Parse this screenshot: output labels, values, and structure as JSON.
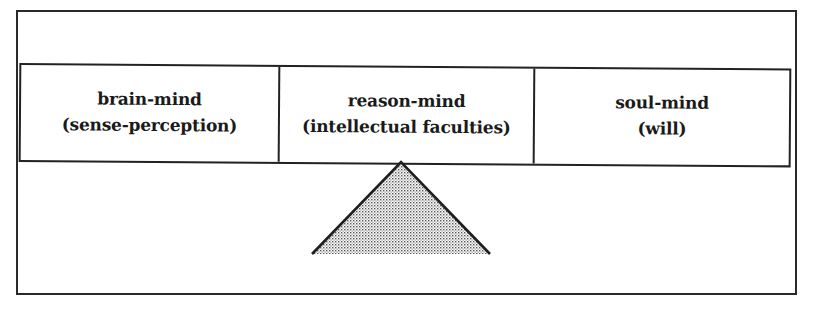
{
  "diagram": {
    "type": "balance-scale",
    "beam": {
      "sections": [
        {
          "title": "brain-mind",
          "subtitle": "(sense-perception)"
        },
        {
          "title": "reason-mind",
          "subtitle": "(intellectual faculties)"
        },
        {
          "title": "soul-mind",
          "subtitle": "(will)"
        }
      ]
    },
    "fulcrum": {
      "shape": "triangle",
      "fill": "stippled-gray",
      "position": "under center section"
    },
    "colors": {
      "stroke": "#222222",
      "fill_dots": "#555555",
      "background": "#ffffff"
    }
  }
}
